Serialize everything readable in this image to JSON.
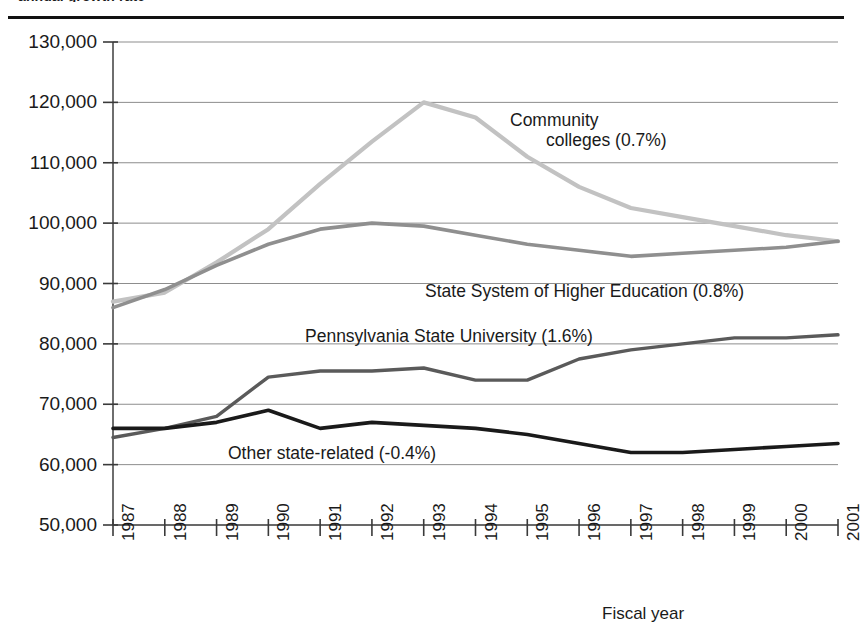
{
  "figure": {
    "clipped_caption": "annual growth rate",
    "axis_title_x": "Fiscal year"
  },
  "chart_data": {
    "type": "line",
    "title": "",
    "subtitle": "",
    "xlabel": "Fiscal year",
    "ylabel": "",
    "grid": true,
    "legend_position": "inline-annotations",
    "x": [
      1987,
      1988,
      1989,
      1990,
      1991,
      1992,
      1993,
      1994,
      1995,
      1996,
      1997,
      1998,
      1999,
      2000,
      2001
    ],
    "categories": [
      "1987",
      "1988",
      "1989",
      "1990",
      "1991",
      "1992",
      "1993",
      "1994",
      "1995",
      "1996",
      "1997",
      "1998",
      "1999",
      "2000",
      "2001"
    ],
    "xlim": [
      1987,
      2001
    ],
    "ylim": [
      50000,
      130000
    ],
    "yticks": [
      50000,
      60000,
      70000,
      80000,
      90000,
      100000,
      110000,
      120000,
      130000
    ],
    "ytick_labels": [
      "50,000",
      "60,000",
      "70,000",
      "80,000",
      "90,000",
      "100,000",
      "110,000",
      "120,000",
      "130,000"
    ],
    "series": [
      {
        "name": "Community colleges",
        "annual_growth_rate": "0.7%",
        "label": "Community colleges (0.7%)",
        "color": "#c2c2c2",
        "values": [
          87000,
          88500,
          93500,
          99000,
          106500,
          113500,
          120000,
          117500,
          111000,
          106000,
          102500,
          101000,
          99500,
          98000,
          97000
        ]
      },
      {
        "name": "State System of Higher Education",
        "annual_growth_rate": "0.8%",
        "label": "State System of Higher Education (0.8%)",
        "color": "#8f8f8f",
        "values": [
          86000,
          89000,
          93000,
          96500,
          99000,
          100000,
          99500,
          98000,
          96500,
          95500,
          94500,
          95000,
          95500,
          96000,
          97000
        ]
      },
      {
        "name": "Pennsylvania State University",
        "annual_growth_rate": "1.6%",
        "label": "Pennsylvania State University (1.6%)",
        "color": "#5a5a5a",
        "values": [
          64500,
          66000,
          68000,
          74500,
          75500,
          75500,
          76000,
          74000,
          74000,
          77500,
          79000,
          80000,
          81000,
          81000,
          81500
        ]
      },
      {
        "name": "Other state-related",
        "annual_growth_rate": "-0.4%",
        "label": "Other state-related (-0.4%)",
        "color": "#1a1a1a",
        "values": [
          66000,
          66000,
          67000,
          69000,
          66000,
          67000,
          66500,
          66000,
          65000,
          63500,
          62000,
          62000,
          62500,
          63000,
          63500
        ]
      }
    ],
    "annotations": [
      {
        "text_line1": "Community",
        "text_line2": "colleges (0.7%)",
        "series": "Community colleges"
      },
      {
        "text_line1": "State System of Higher Education (0.8%)",
        "series": "State System of Higher Education"
      },
      {
        "text_line1": "Pennsylvania State University (1.6%)",
        "series": "Pennsylvania State University"
      },
      {
        "text_line1": "Other state-related (-0.4%)",
        "series": "Other state-related"
      }
    ]
  }
}
